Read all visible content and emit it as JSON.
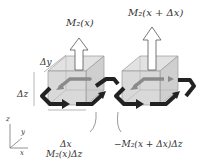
{
  "diagram": {
    "labels": {
      "mz_left": "M₂(x)",
      "mz_right": "M₂(x + Δx)",
      "delta_y": "Δy",
      "delta_z": "Δz",
      "delta_x": "Δx",
      "current_left": "M₂(x)Δz",
      "current_right": "−M₂(x + Δx)Δz",
      "axis_z": "z",
      "axis_y": "y",
      "axis_x": "x"
    },
    "colors": {
      "cube_face": "#d9d9d9",
      "cube_edge": "#9a9a9a",
      "loop_dark": "#222222",
      "loop_gray": "#8a8a8a",
      "text": "#333333"
    }
  }
}
